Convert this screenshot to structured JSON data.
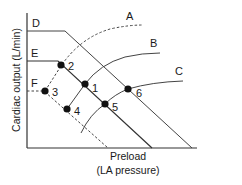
{
  "figure": {
    "y_axis_label": "Cardiac output (L/min)",
    "x_axis_label_line1": "Preload",
    "x_axis_label_line2": "(LA pressure)",
    "colors": {
      "line": "#333333",
      "dot": "#111111",
      "text": "#1a1a1a",
      "background": "#ffffff"
    }
  },
  "curves": {
    "cardiac_function": [
      {
        "label": "A",
        "style": "dashed",
        "description": "uppermost cardiac function curve"
      },
      {
        "label": "B",
        "style": "solid",
        "description": "middle cardiac function curve"
      },
      {
        "label": "C",
        "style": "solid",
        "description": "lowest cardiac function curve"
      }
    ],
    "venous_return": [
      {
        "label": "D",
        "style": "solid",
        "description": "highest venous return curve"
      },
      {
        "label": "E",
        "style": "solid",
        "description": "middle venous return curve"
      },
      {
        "label": "F",
        "style": "dashed",
        "description": "lowest venous return curve"
      }
    ]
  },
  "points": [
    {
      "label": "1",
      "on": [
        "B",
        "E"
      ]
    },
    {
      "label": "2",
      "on": [
        "A",
        "E"
      ]
    },
    {
      "label": "3",
      "on": [
        "A",
        "F"
      ]
    },
    {
      "label": "4",
      "on": [
        "B",
        "F"
      ]
    },
    {
      "label": "5",
      "on": [
        "C",
        "E"
      ]
    },
    {
      "label": "6",
      "on": [
        "C",
        "D"
      ]
    }
  ]
}
